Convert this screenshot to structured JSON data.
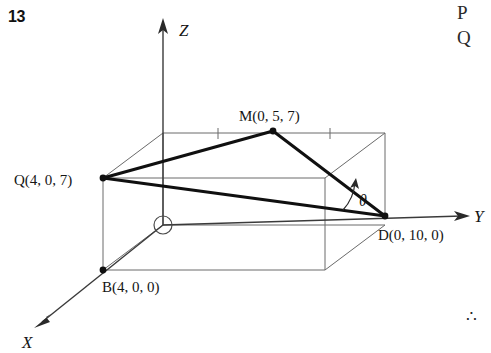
{
  "question_number": "13",
  "margin": {
    "letter_p": "P",
    "letter_q": "Q",
    "therefore_symbol": "∴"
  },
  "figure": {
    "type": "3d-coordinate-diagram",
    "axes": [
      {
        "name": "X",
        "label": "X",
        "direction": "down-left"
      },
      {
        "name": "Y",
        "label": "Y",
        "direction": "right"
      },
      {
        "name": "Z",
        "label": "Z",
        "direction": "up"
      }
    ],
    "origin": {
      "name": "O",
      "marker": "small-circle"
    },
    "points": [
      {
        "id": "Q",
        "label": "Q(4, 0, 7)",
        "coords": [
          4,
          0,
          7
        ]
      },
      {
        "id": "M",
        "label": "M(0, 5, 7)",
        "coords": [
          0,
          5,
          7
        ]
      },
      {
        "id": "D",
        "label": "D(0, 10, 0)",
        "coords": [
          0,
          10,
          0
        ]
      },
      {
        "id": "B",
        "label": "B(4, 0, 0)",
        "coords": [
          4,
          0,
          0
        ]
      }
    ],
    "angle": {
      "label": "θ",
      "vertex": "D",
      "between": [
        "DM",
        "DQ"
      ]
    },
    "tick_marks_on_top_edge": 2,
    "colors": {
      "ink": "#151515",
      "thin_line": "#6a6a6a",
      "background": "#ffffff"
    }
  }
}
